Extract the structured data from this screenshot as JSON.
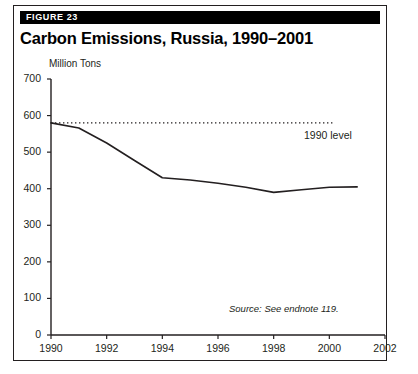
{
  "figure": {
    "badge_label": "FIGURE 23",
    "title": "Carbon Emissions, Russia, 1990–2001",
    "source_note": "Source: See endnote 119.",
    "frame_color": "#231f20",
    "badge_bg_color": "#000000",
    "badge_text_color": "#ffffff"
  },
  "chart_data": {
    "type": "line",
    "title": "Carbon Emissions, Russia, 1990–2001",
    "subtitle": "",
    "xlabel": "",
    "ylabel": "Million Tons",
    "x": [
      1990,
      1991,
      1992,
      1993,
      1994,
      1995,
      1996,
      1997,
      1998,
      1999,
      2000,
      2001
    ],
    "series": [
      {
        "name": "Carbon emissions",
        "values": [
          580,
          566,
          525,
          477,
          430,
          424,
          415,
          404,
          390,
          397,
          404,
          405
        ],
        "color": "#231f20",
        "style": "solid"
      },
      {
        "name": "1990 level",
        "values": [
          580,
          580,
          580,
          580,
          580,
          580,
          580,
          580,
          580,
          580,
          580,
          580
        ],
        "color": "#231f20",
        "style": "dotted",
        "annotation": "1990 level",
        "x_end": 2000.2
      }
    ],
    "xlim": [
      1990,
      2002
    ],
    "ylim": [
      0,
      700
    ],
    "xticks": [
      1990,
      1992,
      1994,
      1996,
      1998,
      2000,
      2002
    ],
    "xtick_labels": [
      "1990",
      "1992",
      "1994",
      "1996",
      "1998",
      "2000",
      "2002"
    ],
    "yticks": [
      0,
      100,
      200,
      300,
      400,
      500,
      600,
      700
    ],
    "ytick_labels": [
      "0",
      "100",
      "200",
      "300",
      "400",
      "500",
      "600",
      "700"
    ],
    "grid": false,
    "legend_position": "inline-annotation",
    "annotations": [
      {
        "text": "1990 level",
        "x": 2000.2,
        "y": 580,
        "align": "right"
      },
      {
        "text": "Source: See endnote 119.",
        "x": 2001.8,
        "y": 90,
        "align": "right",
        "style": "italic"
      }
    ]
  }
}
